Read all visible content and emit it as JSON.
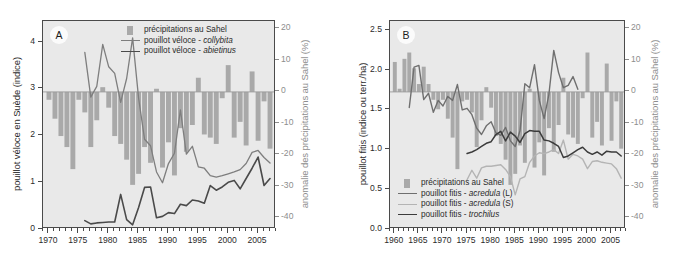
{
  "figure": {
    "background": "#ffffff",
    "plot_background": "#e9e9e9",
    "bar_color": "#a9a9a9",
    "axis_color": "#4a4a4a",
    "right_axis_color": "#8d8d8d"
  },
  "chart_data": [
    {
      "id": "panel-a",
      "type": "bar",
      "panel_label": "A",
      "title": "",
      "xlabel": "",
      "ylabel": "pouillot véloce en Suède (indice)",
      "y2label": "anomalie des précipitations au Sahel (%)",
      "xlim": [
        1969,
        2008
      ],
      "ylim": [
        0,
        4.45
      ],
      "y2lim": [
        -43.5,
        22.5
      ],
      "yticks": [
        0,
        1,
        2,
        3,
        4
      ],
      "ytick_labels": [
        "0",
        "1",
        "2",
        "3",
        "4"
      ],
      "y2ticks": [
        20,
        10,
        0,
        -10,
        -20,
        -30,
        -40
      ],
      "y2tick_labels": [
        "20",
        "10",
        "0",
        "-10",
        "-20",
        "-30",
        "-40"
      ],
      "xticks": [
        1970,
        1975,
        1980,
        1985,
        1990,
        1995,
        2000,
        2005
      ],
      "xtick_labels": [
        "1970",
        "1975",
        "1980",
        "1985",
        "1990",
        "1995",
        "2000",
        "2005"
      ],
      "grid": false,
      "legend_position": "top-center",
      "legend": [
        {
          "label": "précipitations au Sahel",
          "type": "bar",
          "color": "#a9a9a9"
        },
        {
          "label": "pouillot véloce - ",
          "italic": "collybita",
          "type": "line",
          "color": "#7e7e7e",
          "width": 1.3
        },
        {
          "label": "pouillot véloce - ",
          "italic": "abietinus",
          "type": "line",
          "color": "#4a4a4a",
          "width": 1.6
        }
      ],
      "bars": {
        "name": "précipitations au Sahel",
        "color": "#a9a9a9",
        "axis": "y2",
        "x": [
          1970,
          1971,
          1972,
          1973,
          1974,
          1975,
          1976,
          1977,
          1978,
          1979,
          1980,
          1981,
          1982,
          1983,
          1984,
          1985,
          1986,
          1987,
          1988,
          1989,
          1990,
          1991,
          1992,
          1993,
          1994,
          1995,
          1996,
          1997,
          1998,
          1999,
          2000,
          2001,
          2002,
          2003,
          2004,
          2005,
          2006,
          2007
        ],
        "values": [
          -2.5,
          -8.5,
          -14.0,
          -17.5,
          -24.5,
          -2.5,
          -6.5,
          -17.5,
          -9.0,
          1.5,
          -5.0,
          -14.0,
          -16.5,
          -21.5,
          -29.5,
          -26.0,
          -17.5,
          -22.5,
          1.0,
          -24.0,
          -16.0,
          -26.5,
          -11.5,
          -19.0,
          -10.5,
          4.5,
          -13.5,
          -14.5,
          -16.5,
          -2.0,
          8.5,
          -14.5,
          -9.5,
          -17.0,
          6.5,
          -15.5,
          -3.0,
          -18.0
        ]
      },
      "series": [
        {
          "name": "pouillot véloce - collybita",
          "color": "#7e7e7e",
          "width": 1.3,
          "axis": "y1",
          "x": [
            1976,
            1977,
            1978,
            1979,
            1980,
            1981,
            1982,
            1983,
            1984,
            1985,
            1986,
            1987,
            1988,
            1989,
            1990,
            1991,
            1992,
            1993,
            1994,
            1995,
            1996,
            1997,
            1998,
            1999,
            2000,
            2001,
            2002,
            2003,
            2004,
            2005,
            2006,
            2007
          ],
          "values": [
            3.78,
            2.82,
            3.05,
            3.95,
            3.47,
            3.33,
            2.71,
            3.22,
            4.09,
            2.8,
            1.92,
            1.78,
            1.22,
            0.99,
            1.4,
            1.62,
            2.55,
            1.6,
            1.77,
            1.33,
            1.3,
            1.14,
            1.11,
            1.14,
            1.18,
            1.22,
            1.27,
            1.4,
            1.64,
            1.68,
            1.53,
            1.41
          ]
        },
        {
          "name": "pouillot véloce - abietinus",
          "color": "#4a4a4a",
          "width": 1.6,
          "axis": "y1",
          "x": [
            1976,
            1977,
            1978,
            1979,
            1980,
            1981,
            1982,
            1983,
            1984,
            1985,
            1986,
            1987,
            1988,
            1989,
            1990,
            1991,
            1992,
            1993,
            1994,
            1995,
            1996,
            1997,
            1998,
            1999,
            2000,
            2001,
            2002,
            2003,
            2004,
            2005,
            2006,
            2007
          ],
          "values": [
            0.18,
            0.11,
            0.13,
            0.14,
            0.15,
            0.15,
            0.74,
            0.2,
            0.09,
            0.46,
            0.89,
            0.9,
            0.24,
            0.27,
            0.35,
            0.33,
            0.53,
            0.5,
            0.62,
            0.6,
            0.55,
            0.93,
            0.83,
            0.9,
            1.0,
            1.04,
            0.86,
            1.08,
            1.3,
            1.54,
            0.93,
            1.08
          ]
        }
      ]
    },
    {
      "id": "panel-b",
      "type": "bar",
      "panel_label": "B",
      "title": "",
      "xlabel": "",
      "ylabel": "pouillot fitis (indice ou terr./ha)",
      "y2label": "anomalie des précipitations au Sahel (%)",
      "xlim": [
        1959,
        2008
      ],
      "ylim": [
        0.0,
        2.62
      ],
      "y2lim": [
        -43.5,
        22.5
      ],
      "yticks": [
        0.0,
        0.5,
        1.0,
        1.5,
        2.0,
        2.5
      ],
      "ytick_labels": [
        "0.0",
        "0.5",
        "1.0",
        "1.5",
        "2.0",
        "2.5"
      ],
      "y2ticks": [
        20,
        10,
        0,
        -10,
        -20,
        -30,
        -40
      ],
      "y2tick_labels": [
        "20",
        "10",
        "0",
        "-10",
        "-20",
        "-30",
        "-40"
      ],
      "xticks": [
        1960,
        1965,
        1970,
        1975,
        1980,
        1985,
        1990,
        1995,
        2000,
        2005
      ],
      "xtick_labels": [
        "1960",
        "1965",
        "1970",
        "1975",
        "1980",
        "1985",
        "1990",
        "1995",
        "2000",
        "2005"
      ],
      "grid": false,
      "legend_position": "bottom-left",
      "legend": [
        {
          "label": "précipitations au Sahel",
          "type": "bar",
          "color": "#a9a9a9"
        },
        {
          "label": "pouillot fitis - ",
          "italic": "acredula",
          "suffix": " (L)",
          "type": "line",
          "color": "#6f6f6f",
          "width": 1.4
        },
        {
          "label": "pouillot fitis - ",
          "italic": "acredula",
          "suffix": " (S)",
          "type": "line",
          "color": "#b4b4b4",
          "width": 1.4
        },
        {
          "label": "pouillot fitis - ",
          "italic": "trochilus",
          "suffix": "",
          "type": "line",
          "color": "#3c3c3c",
          "width": 1.5
        }
      ],
      "bars": {
        "name": "précipitations au Sahel",
        "color": "#a9a9a9",
        "axis": "y2",
        "x": [
          1960,
          1961,
          1962,
          1963,
          1964,
          1965,
          1966,
          1967,
          1968,
          1969,
          1970,
          1971,
          1972,
          1973,
          1974,
          1975,
          1976,
          1977,
          1978,
          1979,
          1980,
          1981,
          1982,
          1983,
          1984,
          1985,
          1986,
          1987,
          1988,
          1989,
          1990,
          1991,
          1992,
          1993,
          1994,
          1995,
          1996,
          1997,
          1998,
          1999,
          2000,
          2001,
          2002,
          2003,
          2004,
          2005,
          2006,
          2007
        ],
        "values": [
          9.5,
          1.0,
          10.5,
          12.5,
          7.5,
          2.5,
          8.0,
          2.5,
          -2.5,
          -5.5,
          -2.5,
          -8.5,
          -14.5,
          -24.5,
          -3.0,
          -2.5,
          -6.5,
          -17.5,
          -9.0,
          1.5,
          -5.0,
          -14.0,
          -16.5,
          -21.5,
          -29.5,
          -26.0,
          -17.0,
          -22.5,
          1.0,
          -24.0,
          -16.0,
          -26.5,
          -11.5,
          -19.0,
          -10.5,
          4.5,
          -13.5,
          -14.5,
          -16.5,
          -2.0,
          12.5,
          -14.5,
          -9.5,
          -17.0,
          9.0,
          -15.5,
          -3.0,
          -18.0
        ]
      },
      "series": [
        {
          "name": "pouillot fitis - acredula (L)",
          "color": "#6f6f6f",
          "width": 1.4,
          "axis": "y1",
          "x": [
            1963,
            1964,
            1965,
            1966,
            1967,
            1968,
            1969,
            1970,
            1971,
            1972,
            1973,
            1974,
            1975,
            1976,
            1977,
            1978,
            1979,
            1980,
            1981,
            1982,
            1983,
            1984,
            1985,
            1986,
            1987,
            1988,
            1989,
            1990,
            1991,
            1992,
            1993,
            1994,
            1995,
            1996,
            1997,
            1998
          ],
          "values": [
            1.53,
            2.04,
            2.06,
            1.63,
            1.71,
            1.47,
            1.62,
            1.55,
            1.67,
            1.62,
            1.82,
            1.5,
            1.52,
            1.44,
            1.27,
            1.19,
            1.3,
            1.35,
            1.21,
            1.18,
            1.28,
            1.11,
            1.04,
            1.24,
            1.83,
            1.78,
            2.07,
            1.62,
            1.39,
            1.7,
            2.25,
            1.97,
            1.78,
            1.81,
            1.92,
            1.76
          ]
        },
        {
          "name": "pouillot fitis - acredula (S)",
          "color": "#b4b4b4",
          "width": 1.4,
          "axis": "y1",
          "x": [
            1975,
            1976,
            1977,
            1978,
            1979,
            1980,
            1981,
            1982,
            1983,
            1984,
            1985,
            1986,
            1987,
            1988,
            1989,
            1990,
            1991,
            1992,
            1993,
            1994,
            1995,
            1996,
            1997,
            1998,
            1999,
            2000,
            2001,
            2002,
            2003,
            2004,
            2005,
            2006,
            2007
          ],
          "values": [
            0.62,
            0.74,
            0.64,
            0.77,
            0.79,
            0.79,
            0.8,
            0.81,
            0.75,
            0.66,
            0.43,
            0.63,
            0.66,
            0.84,
            0.92,
            0.96,
            0.95,
            0.97,
            1.0,
            0.95,
            1.12,
            0.88,
            0.94,
            0.92,
            0.88,
            0.76,
            0.85,
            0.86,
            0.84,
            0.83,
            0.82,
            0.76,
            0.64
          ]
        },
        {
          "name": "pouillot fitis - trochilus",
          "color": "#3c3c3c",
          "width": 1.5,
          "axis": "y1",
          "x": [
            1975,
            1976,
            1977,
            1978,
            1979,
            1980,
            1981,
            1982,
            1983,
            1984,
            1985,
            1986,
            1987,
            1988,
            1989,
            1990,
            1991,
            1992,
            1993,
            1994,
            1995,
            1996,
            1997,
            1998,
            1999,
            2000,
            2001,
            2002,
            2003,
            2004,
            2005,
            2006,
            2007
          ],
          "values": [
            0.95,
            0.97,
            1.0,
            1.04,
            1.08,
            1.1,
            1.19,
            1.23,
            1.11,
            1.22,
            1.17,
            1.09,
            1.2,
            1.24,
            1.23,
            1.23,
            1.12,
            1.11,
            1.08,
            1.04,
            0.9,
            0.92,
            0.96,
            1.0,
            1.03,
            0.97,
            0.94,
            0.97,
            0.93,
            0.98,
            0.97,
            0.97,
            0.92
          ]
        }
      ]
    }
  ]
}
